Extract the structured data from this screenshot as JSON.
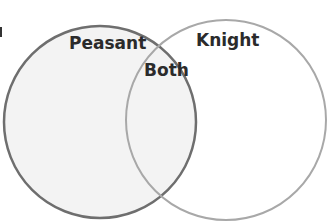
{
  "diagram": {
    "type": "venn",
    "sets": [
      {
        "label": "Peasant",
        "fill": "#f3f3f3",
        "stroke": "#6e6e6e"
      },
      {
        "label": "Knight",
        "fill": "#ffffff",
        "stroke": "#a8a8a8"
      }
    ],
    "intersection": {
      "label": "Both"
    }
  }
}
